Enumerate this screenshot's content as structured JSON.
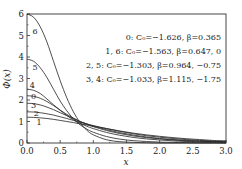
{
  "chart_data": {
    "type": "line",
    "title": "",
    "xlabel": "x",
    "ylabel": "Φ(x)",
    "xlim": [
      0,
      3.0
    ],
    "ylim": [
      0,
      6
    ],
    "xticks": [
      "0.0",
      "0.5",
      "1.0",
      "1.5",
      "2.0",
      "2.5",
      "3.0"
    ],
    "xtick_values": [
      0,
      0.5,
      1.0,
      1.5,
      2.0,
      2.5,
      3.0
    ],
    "yticks": [
      "0",
      "1",
      "2",
      "3",
      "4",
      "5",
      "6"
    ],
    "ytick_values": [
      0,
      1,
      2,
      3,
      4,
      5,
      6
    ],
    "grid": false,
    "legend": {
      "placement": "top-right",
      "entries": [
        "0: C₀=−1.626, β=0.365",
        "1, 6: C₀=−1.563, β=0.647, 0",
        "2, 5: C₀=−1.303, β=0.964, −0.75",
        "3, 4: C₀=−1.033, β=1.115, −1.75"
      ]
    },
    "x": [
      0.0,
      0.1,
      0.2,
      0.3,
      0.4,
      0.5,
      0.6,
      0.7,
      0.8,
      0.9,
      1.0,
      1.2,
      1.4,
      1.6,
      1.8,
      2.0,
      2.2,
      2.4,
      2.6,
      2.8,
      3.0
    ],
    "series": [
      {
        "name": "6",
        "values": [
          6.0,
          5.85,
          5.4,
          4.7,
          3.8,
          2.9,
          2.1,
          1.45,
          0.95,
          0.6,
          0.38,
          0.15,
          0.06,
          0.03,
          0.01,
          0.0,
          0.0,
          0.0,
          0.0,
          0.0,
          0.0
        ]
      },
      {
        "name": "5",
        "values": [
          3.9,
          3.8,
          3.5,
          3.05,
          2.5,
          1.95,
          1.5,
          1.12,
          0.85,
          0.65,
          0.5,
          0.3,
          0.18,
          0.11,
          0.07,
          0.04,
          0.03,
          0.02,
          0.01,
          0.01,
          0.0
        ]
      },
      {
        "name": "4",
        "values": [
          2.5,
          2.45,
          2.3,
          2.05,
          1.78,
          1.52,
          1.28,
          1.08,
          0.92,
          0.78,
          0.67,
          0.49,
          0.36,
          0.26,
          0.19,
          0.14,
          0.1,
          0.07,
          0.05,
          0.04,
          0.03
        ]
      },
      {
        "name": "0",
        "values": [
          2.2,
          2.17,
          2.08,
          1.93,
          1.74,
          1.53,
          1.33,
          1.16,
          1.0,
          0.87,
          0.76,
          0.58,
          0.44,
          0.33,
          0.25,
          0.19,
          0.14,
          0.1,
          0.08,
          0.06,
          0.04
        ]
      },
      {
        "name": "3",
        "values": [
          1.85,
          1.83,
          1.77,
          1.67,
          1.55,
          1.41,
          1.27,
          1.13,
          1.0,
          0.89,
          0.79,
          0.62,
          0.48,
          0.37,
          0.28,
          0.21,
          0.16,
          0.12,
          0.09,
          0.07,
          0.05
        ]
      },
      {
        "name": "2",
        "values": [
          1.45,
          1.44,
          1.41,
          1.36,
          1.3,
          1.22,
          1.14,
          1.05,
          0.97,
          0.89,
          0.81,
          0.67,
          0.54,
          0.43,
          0.34,
          0.27,
          0.21,
          0.16,
          0.12,
          0.09,
          0.07
        ]
      },
      {
        "name": "1",
        "values": [
          1.2,
          1.19,
          1.17,
          1.14,
          1.1,
          1.05,
          1.0,
          0.95,
          0.89,
          0.84,
          0.78,
          0.67,
          0.56,
          0.46,
          0.38,
          0.31,
          0.25,
          0.2,
          0.16,
          0.12,
          0.1
        ]
      }
    ],
    "curve_labels": [
      {
        "text": "6",
        "x": 0.12,
        "y": 5.05
      },
      {
        "text": "5",
        "x": 0.12,
        "y": 3.4
      },
      {
        "text": "4",
        "x": 0.08,
        "y": 2.55
      },
      {
        "text": "0",
        "x": 0.1,
        "y": 2.05
      },
      {
        "text": "3",
        "x": 0.1,
        "y": 1.65
      },
      {
        "text": "2",
        "x": 0.14,
        "y": 1.25
      },
      {
        "text": "1",
        "x": 0.18,
        "y": 0.85
      }
    ]
  }
}
